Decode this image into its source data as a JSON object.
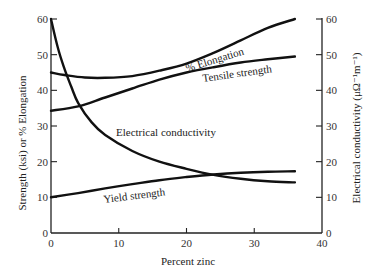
{
  "chart_data": {
    "type": "line",
    "title": "",
    "xlabel": "Percent zinc",
    "ylabel": "Strength (ksi) or % Elongation",
    "y2label": "Electrical conductivity (μΩ⁻¹m⁻¹)",
    "xlim": [
      0,
      40
    ],
    "ylim": [
      0,
      60
    ],
    "y2lim": [
      0,
      60
    ],
    "xticks": [
      0,
      10,
      20,
      30,
      40
    ],
    "yticks": [
      0,
      10,
      20,
      30,
      40,
      50,
      60
    ],
    "y2ticks": [
      0,
      10,
      20,
      30,
      40,
      50,
      60
    ],
    "grid": false,
    "legend": "inline labels on curves",
    "series": [
      {
        "name": "% Elongation",
        "axis": "left",
        "x": [
          0,
          2,
          5,
          8,
          12,
          16,
          20,
          24,
          28,
          32,
          36
        ],
        "values": [
          45,
          44.3,
          43.6,
          43.5,
          44,
          45.5,
          47.5,
          50.5,
          54,
          57.5,
          60
        ]
      },
      {
        "name": "Tensile strength",
        "axis": "left",
        "x": [
          0,
          4,
          8,
          12,
          16,
          20,
          24,
          28,
          32,
          36
        ],
        "values": [
          34.3,
          35.5,
          38,
          40.5,
          43,
          45,
          46.5,
          47.8,
          48.7,
          49.5
        ]
      },
      {
        "name": "Electrical conductivity",
        "axis": "right",
        "x": [
          0,
          1,
          2,
          3,
          4,
          6,
          8,
          12,
          16,
          20,
          24,
          28,
          32,
          36
        ],
        "values": [
          60,
          52,
          46,
          41,
          36.5,
          31,
          27.5,
          23,
          20,
          18,
          16.3,
          15.2,
          14.5,
          14.2
        ]
      },
      {
        "name": "Yield strength",
        "axis": "left",
        "x": [
          0,
          4,
          8,
          12,
          16,
          20,
          24,
          28,
          32,
          36
        ],
        "values": [
          10,
          11.2,
          12.5,
          13.7,
          14.8,
          15.7,
          16.4,
          16.9,
          17.2,
          17.3
        ]
      }
    ]
  },
  "labels": {
    "elongation": "% Elongation",
    "tensile": "Tensile strength",
    "conductivity": "Electrical conductivity",
    "yield": "Yield strength",
    "xaxis": "Percent zinc",
    "yaxis_left": "Strength (ksi) or % Elongation",
    "yaxis_right": "Electrical conductivity (μΩ⁻¹m⁻¹)"
  },
  "colors": {
    "curve": "#111111",
    "axis": "#222222",
    "background": "#ffffff"
  }
}
